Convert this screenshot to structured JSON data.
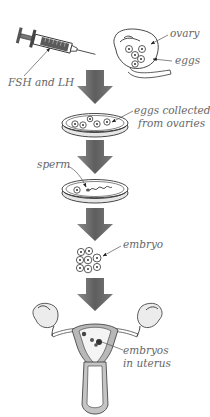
{
  "colors": {
    "arrow": "#6e6e6e",
    "ink": "#333333",
    "label": "#666666",
    "shade": "#b5b5b5",
    "embryo_dark": "#444444"
  },
  "steps": [
    {
      "id": "hormone-injection",
      "labels": [
        "FSH and LH"
      ]
    },
    {
      "id": "ovary",
      "labels": [
        "ovary",
        "eggs"
      ]
    },
    {
      "id": "egg-collection",
      "labels": [
        "eggs collected",
        "from ovaries"
      ]
    },
    {
      "id": "fertilisation",
      "labels": [
        "sperm"
      ]
    },
    {
      "id": "embryo",
      "labels": [
        "embryo"
      ]
    },
    {
      "id": "implantation",
      "labels": [
        "embryos",
        "in uterus"
      ]
    }
  ],
  "labels": {
    "fsh_lh": "FSH and LH",
    "ovary": "ovary",
    "eggs": "eggs",
    "eggs_collected_1": "eggs collected",
    "eggs_collected_2": "from ovaries",
    "sperm": "sperm",
    "embryo": "embryo",
    "embryos_1": "embryos",
    "embryos_2": "in uterus"
  },
  "arrows": [
    {
      "y": 70
    },
    {
      "y": 140
    },
    {
      "y": 208
    },
    {
      "y": 278
    }
  ]
}
